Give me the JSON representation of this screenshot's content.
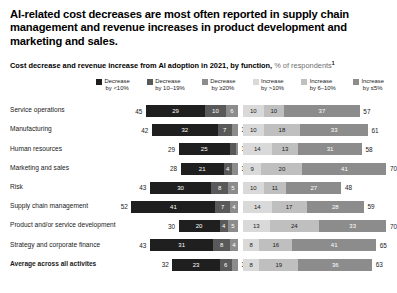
{
  "headline": "AI-related cost decreases are most often reported in supply chain management and revenue increases in product development and marketing and sales.",
  "subtitle": {
    "bold": "Cost decrease and revenue increase from AI adoption in 2021, by function,",
    "light": " % of respondents",
    "footnote_marker": "1"
  },
  "colors": {
    "decrease_lt10": "#1f1f1f",
    "decrease_10_19": "#595959",
    "decrease_gte20": "#8c8c8c",
    "increase_gt10": "#d9d9d9",
    "increase_6_10": "#bfbfbf",
    "increase_lte5": "#8c8c8c"
  },
  "legend": [
    {
      "label_line1": "Decrease",
      "label_line2": "by <10%",
      "color": "#1f1f1f"
    },
    {
      "label_line1": "Decrease",
      "label_line2": "by 10–19%",
      "color": "#595959"
    },
    {
      "label_line1": "Decrease",
      "label_line2": "by ≥20%",
      "color": "#8c8c8c"
    },
    {
      "label_line1": "Increase",
      "label_line2": "by >10%",
      "color": "#d9d9d9"
    },
    {
      "label_line1": "Increase",
      "label_line2": "by 6–10%",
      "color": "#bfbfbf"
    },
    {
      "label_line1": "Increase",
      "label_line2": "by ≤5%",
      "color": "#8c8c8c"
    }
  ],
  "chart_data": {
    "type": "bar",
    "title": "AI-related cost decreases are most often reported in supply chain management and revenue increases in product development and marketing and sales.",
    "subtitle": "Cost decrease and revenue increase from AI adoption in 2021, by function, % of respondents",
    "xlabel": "",
    "ylabel": "",
    "orientation": "horizontal",
    "stacked": true,
    "diverging": true,
    "grid": false,
    "legend_position": "top",
    "categories": [
      "Service operations",
      "Manufacturing",
      "Human resources",
      "Marketing and sales",
      "Risk",
      "Supply chain management",
      "Product and/or service development",
      "Strategy and corporate finance",
      "Average across all activites"
    ],
    "series": [
      {
        "name": "Decrease by <10%",
        "side": "left",
        "values": [
          29,
          32,
          25,
          21,
          30,
          41,
          20,
          31,
          23
        ]
      },
      {
        "name": "Decrease by 10–19%",
        "side": "left",
        "values": [
          10,
          7,
          3,
          4,
          8,
          7,
          4,
          8,
          6
        ]
      },
      {
        "name": "Decrease by ≥20%",
        "side": "left",
        "values": [
          6,
          3,
          1,
          3,
          5,
          4,
          5,
          4,
          3
        ]
      },
      {
        "name": "Increase by >10%",
        "side": "right",
        "values": [
          10,
          10,
          14,
          9,
          10,
          14,
          13,
          8,
          8
        ]
      },
      {
        "name": "Increase by 6–10%",
        "side": "right",
        "values": [
          10,
          18,
          13,
          20,
          11,
          17,
          24,
          16,
          19
        ]
      },
      {
        "name": "Increase by ≤5%",
        "side": "right",
        "values": [
          37,
          33,
          31,
          41,
          27,
          28,
          33,
          41,
          36
        ]
      }
    ],
    "left_totals": [
      45,
      42,
      29,
      28,
      43,
      52,
      30,
      43,
      32
    ],
    "right_totals": [
      57,
      61,
      58,
      70,
      48,
      59,
      70,
      65,
      63
    ]
  }
}
